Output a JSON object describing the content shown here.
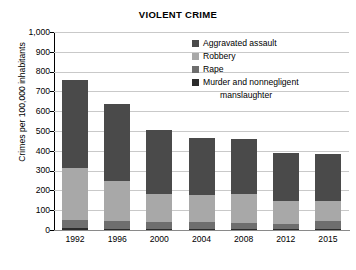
{
  "chart_data": {
    "type": "bar",
    "subtype": "stacked-bar",
    "title": "VIOLENT CRIME",
    "xlabel": "",
    "ylabel": "Crimes per 100,000 inhabitants",
    "categories": [
      "1992",
      "1996",
      "2000",
      "2004",
      "2008",
      "2012",
      "2015"
    ],
    "ylim": [
      0,
      1000
    ],
    "yticks": [
      0,
      100,
      200,
      300,
      400,
      500,
      600,
      700,
      800,
      900,
      1000
    ],
    "ytick_labels": [
      "0",
      "100",
      "200",
      "300",
      "400",
      "500",
      "600",
      "700",
      "800",
      "900",
      "1,000"
    ],
    "grid": true,
    "legend_position": "top-right",
    "stack_order_bottom_to_top": [
      "Murder and nonnegligent manslaughter",
      "Rape",
      "Robbery",
      "Aggravated assault"
    ],
    "series": [
      {
        "name": "Aggravated assault",
        "color": "#4a4a4a",
        "values": [
          442,
          391,
          324,
          289,
          277,
          243,
          238
        ]
      },
      {
        "name": "Robbery",
        "color": "#a8a8a8",
        "values": [
          264,
          202,
          145,
          137,
          146,
          113,
          102
        ]
      },
      {
        "name": "Rape",
        "color": "#6e6e6e",
        "values": [
          42,
          37,
          32,
          32,
          30,
          27,
          38
        ]
      },
      {
        "name": "Murder and nonnegligent manslaughter",
        "color": "#2b2b2b",
        "values": [
          9,
          7,
          6,
          6,
          5,
          5,
          5
        ]
      }
    ],
    "totals": [
      757,
      637,
      507,
      464,
      458,
      388,
      383
    ]
  },
  "legend": {
    "items": [
      {
        "label": "Aggravated assault",
        "color": "#4a4a4a"
      },
      {
        "label": "Robbery",
        "color": "#a8a8a8"
      },
      {
        "label": "Rape",
        "color": "#6e6e6e"
      },
      {
        "label": "Murder and nonnegligent",
        "color": "#2b2b2b"
      }
    ],
    "continuation_label": "manslaughter"
  },
  "style": {
    "gridline_color": "#c9c9c9",
    "axis_color": "#000000",
    "background": "#ffffff"
  }
}
